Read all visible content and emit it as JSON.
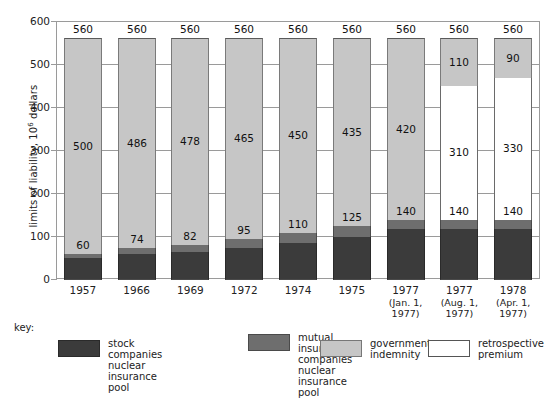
{
  "chart_data": {
    "type": "bar",
    "subtype": "stacked-bar",
    "title": "",
    "xlabel": "",
    "ylabel": "limits of liability, 10^6 dollars",
    "ylim": [
      0,
      600
    ],
    "yticks": [
      0,
      100,
      200,
      300,
      400,
      500,
      600
    ],
    "grid": true,
    "legend_position": "bottom",
    "categories": [
      "1957",
      "1966",
      "1969",
      "1972",
      "1974",
      "1975",
      "1977 (Jan. 1, 1977)",
      "1977 (Aug. 1, 1977)",
      "1978 (Apr. 1, 1977)"
    ],
    "series": [
      {
        "name": "stock companies nuclear insurance pool",
        "color": "#3b3b3b",
        "values": [
          50,
          60,
          66,
          75,
          85,
          100,
          118,
          118,
          118
        ]
      },
      {
        "name": "mutual insurance companies nuclear insurance pool",
        "color": "#6e6e6e",
        "values": [
          10,
          14,
          16,
          20,
          25,
          25,
          22,
          22,
          22
        ]
      },
      {
        "name": "retrospective premium",
        "color": "#ffffff",
        "values": [
          0,
          0,
          0,
          0,
          0,
          0,
          0,
          310,
          330
        ]
      },
      {
        "name": "government indemnity",
        "color": "#c6c6c6",
        "values": [
          500,
          486,
          478,
          465,
          450,
          435,
          420,
          110,
          90
        ]
      }
    ],
    "totals": [
      560,
      560,
      560,
      560,
      560,
      560,
      560,
      560,
      560
    ],
    "bar_labels": [
      {
        "category": "1957",
        "total": 560,
        "segments": [
          {
            "series": "stock companies nuclear insurance pool",
            "value": 50,
            "label": ""
          },
          {
            "series": "mutual insurance companies nuclear insurance pool",
            "value": 10,
            "label": ""
          },
          {
            "series": "government indemnity",
            "value": 500,
            "label": "500"
          }
        ],
        "pool_label": "60"
      },
      {
        "category": "1966",
        "total": 560,
        "segments": [
          {
            "series": "stock companies nuclear insurance pool",
            "value": 60,
            "label": ""
          },
          {
            "series": "mutual insurance companies nuclear insurance pool",
            "value": 14,
            "label": ""
          },
          {
            "series": "government indemnity",
            "value": 486,
            "label": "486"
          }
        ],
        "pool_label": "74"
      },
      {
        "category": "1969",
        "total": 560,
        "segments": [
          {
            "series": "stock companies nuclear insurance pool",
            "value": 66,
            "label": ""
          },
          {
            "series": "mutual insurance companies nuclear insurance pool",
            "value": 16,
            "label": ""
          },
          {
            "series": "government indemnity",
            "value": 478,
            "label": "478"
          }
        ],
        "pool_label": "82"
      },
      {
        "category": "1972",
        "total": 560,
        "segments": [
          {
            "series": "stock companies nuclear insurance pool",
            "value": 75,
            "label": ""
          },
          {
            "series": "mutual insurance companies nuclear insurance pool",
            "value": 20,
            "label": ""
          },
          {
            "series": "government indemnity",
            "value": 465,
            "label": "465"
          }
        ],
        "pool_label": "95"
      },
      {
        "category": "1974",
        "total": 560,
        "segments": [
          {
            "series": "stock companies nuclear insurance pool",
            "value": 85,
            "label": ""
          },
          {
            "series": "mutual insurance companies nuclear insurance pool",
            "value": 25,
            "label": ""
          },
          {
            "series": "government indemnity",
            "value": 450,
            "label": "450"
          }
        ],
        "pool_label": "110"
      },
      {
        "category": "1975",
        "total": 560,
        "segments": [
          {
            "series": "stock companies nuclear insurance pool",
            "value": 100,
            "label": ""
          },
          {
            "series": "mutual insurance companies nuclear insurance pool",
            "value": 25,
            "label": ""
          },
          {
            "series": "government indemnity",
            "value": 435,
            "label": "435"
          }
        ],
        "pool_label": "125"
      },
      {
        "category": "1977 (Jan. 1, 1977)",
        "total": 560,
        "segments": [
          {
            "series": "stock companies nuclear insurance pool",
            "value": 118,
            "label": ""
          },
          {
            "series": "mutual insurance companies nuclear insurance pool",
            "value": 22,
            "label": ""
          },
          {
            "series": "government indemnity",
            "value": 420,
            "label": "420"
          }
        ],
        "pool_label": "140"
      },
      {
        "category": "1977 (Aug. 1, 1977)",
        "total": 560,
        "segments": [
          {
            "series": "stock companies nuclear insurance pool",
            "value": 118,
            "label": ""
          },
          {
            "series": "mutual insurance companies nuclear insurance pool",
            "value": 22,
            "label": ""
          },
          {
            "series": "retrospective premium",
            "value": 310,
            "label": "310"
          },
          {
            "series": "government indemnity",
            "value": 110,
            "label": "110"
          }
        ],
        "pool_label": "140"
      },
      {
        "category": "1978 (Apr. 1, 1977)",
        "total": 560,
        "segments": [
          {
            "series": "stock companies nuclear insurance pool",
            "value": 118,
            "label": ""
          },
          {
            "series": "mutual insurance companies nuclear insurance pool",
            "value": 22,
            "label": ""
          },
          {
            "series": "retrospective premium",
            "value": 330,
            "label": "330"
          },
          {
            "series": "government indemnity",
            "value": 90,
            "label": "90"
          }
        ],
        "pool_label": "140"
      }
    ]
  },
  "axis": {
    "y_title_main": "limits of liability, 10",
    "y_title_exp": "6",
    "y_title_tail": " dollars",
    "y_ticks": [
      "600",
      "500",
      "400",
      "300",
      "200",
      "100",
      "0"
    ],
    "x_labels": [
      {
        "main": "1957",
        "sub1": "",
        "sub2": ""
      },
      {
        "main": "1966",
        "sub1": "",
        "sub2": ""
      },
      {
        "main": "1969",
        "sub1": "",
        "sub2": ""
      },
      {
        "main": "1972",
        "sub1": "",
        "sub2": ""
      },
      {
        "main": "1974",
        "sub1": "",
        "sub2": ""
      },
      {
        "main": "1975",
        "sub1": "",
        "sub2": ""
      },
      {
        "main": "1977",
        "sub1": "(Jan. 1,",
        "sub2": "1977)"
      },
      {
        "main": "1977",
        "sub1": "(Aug. 1,",
        "sub2": "1977)"
      },
      {
        "main": "1978",
        "sub1": "(Apr. 1,",
        "sub2": "1977)"
      }
    ]
  },
  "bar_totals": [
    "560",
    "560",
    "560",
    "560",
    "560",
    "560",
    "560",
    "560",
    "560"
  ],
  "pool_labels": [
    "60",
    "74",
    "82",
    "95",
    "110",
    "125",
    "140",
    "140",
    "140"
  ],
  "gov_labels": [
    "500",
    "486",
    "478",
    "465",
    "450",
    "435",
    "420",
    "110",
    "90"
  ],
  "retro_labels": [
    "",
    "",
    "",
    "",
    "",
    "",
    "",
    "310",
    "330"
  ],
  "legend": {
    "title": "key:",
    "items": [
      {
        "swatch": "stock-pool-swatch",
        "label": "stock companies\nnuclear insurance\npool"
      },
      {
        "swatch": "mutual-pool-swatch",
        "label": "mutual insurance\ncompanies\nnuclear insurance\npool"
      },
      {
        "swatch": "government-indemnity-swatch",
        "label": "government\nindemnity"
      },
      {
        "swatch": "retrospective-premium-swatch",
        "label": "retrospective\npremium"
      }
    ]
  },
  "colors": {
    "stock_pool": "#3b3b3b",
    "mutual_pool": "#6e6e6e",
    "government_indemnity": "#c6c6c6",
    "retrospective_premium": "#ffffff",
    "frame": "#9a9a9a",
    "text": "#1a1a1a"
  }
}
